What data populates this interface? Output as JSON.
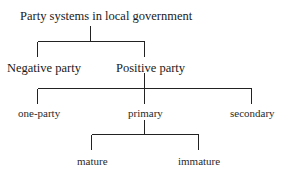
{
  "diagram": {
    "type": "tree",
    "root": {
      "label": "Party systems in local government",
      "children": [
        {
          "label": "Negative party"
        },
        {
          "label": "Positive party",
          "children": [
            {
              "label": "one-party"
            },
            {
              "label": "primary",
              "children": [
                {
                  "label": "mature"
                },
                {
                  "label": "immature"
                }
              ]
            },
            {
              "label": "secondary"
            }
          ]
        }
      ]
    }
  },
  "labels": {
    "root": "Party systems in local government",
    "negative": "Negative party",
    "positive": "Positive party",
    "one_party": "one-party",
    "primary": "primary",
    "secondary": "secondary",
    "mature": "mature",
    "immature": "immature"
  },
  "colors": {
    "line": "#222222",
    "text": "#1a1a1a",
    "background": "#ffffff"
  }
}
